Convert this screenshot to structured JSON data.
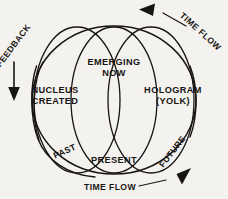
{
  "diagram": {
    "background_color": "#f4f2ef",
    "ink_color": "#171513",
    "inner_labels": {
      "nucleus_line1": "NUCLEUS",
      "nucleus_line2": "CREATED",
      "emerging_line1": "EMERGING",
      "emerging_line2": "NOW",
      "hologram_line1": "HOLOGRAM",
      "hologram_line2": "(YOLK)",
      "present": "PRESENT"
    },
    "arc_labels": {
      "feedback": "FEEDBACK",
      "time_flow_top": "TIME FLOW",
      "time_flow_bottom": "TIME FLOW",
      "past": "PAST",
      "future": "FUTURE"
    },
    "arrows": [
      {
        "name": "feedback-arrow",
        "direction": "down"
      },
      {
        "name": "time-flow-top-arrow",
        "direction": "left"
      },
      {
        "name": "time-flow-bottom-arrow",
        "direction": "up-right"
      }
    ]
  }
}
